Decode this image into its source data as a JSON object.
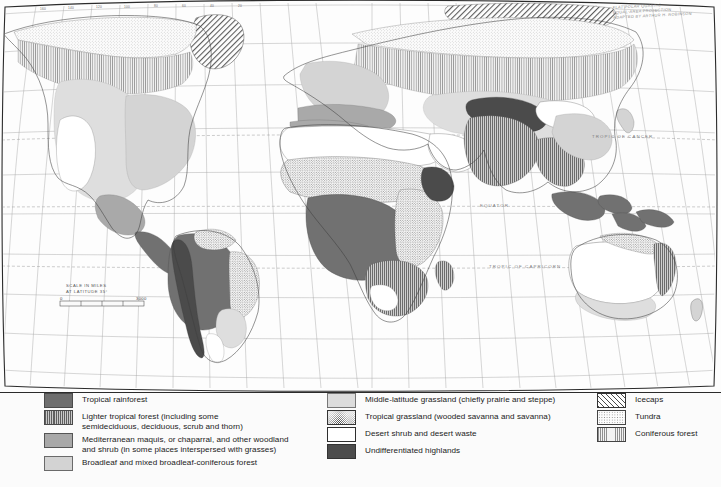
{
  "map": {
    "title": "World Natural Vegetation Map",
    "projection_credit": {
      "line1": "FLAT POLAR QUARTIC",
      "line2": "EQUAL-AREA PROJECTION",
      "line3": "ADAPTED BY ARTHUR H. ROBINSON"
    },
    "labels": {
      "tropic_of_cancer": "TROPIC OF CANCER",
      "equator": "EQUATOR",
      "tropic_of_capricorn": "TROPIC OF CAPRICORN"
    },
    "scale_bar": {
      "line1": "SCALE IN MILES",
      "line2": "AT LATITUDE 35°",
      "min": "0",
      "max": "3000"
    },
    "graticule_longitude_labels": [
      "160",
      "140",
      "120",
      "100",
      "80",
      "60",
      "40",
      "20"
    ],
    "graticule_longitude_x": [
      42,
      70,
      98,
      126,
      154,
      182,
      210,
      238
    ]
  },
  "legend": {
    "columns": [
      {
        "id": "column-1",
        "items": [
          {
            "swatch": "sw-rainforest",
            "name": "tropical-rainforest",
            "label": "Tropical rainforest"
          },
          {
            "swatch": "sw-lighter-tropical",
            "name": "lighter-tropical-forest",
            "label": "Lighter tropical forest (including some\nsemideciduous, deciduous, scrub and thorn)"
          },
          {
            "swatch": "sw-mediterranean",
            "name": "mediterranean-maquis",
            "label": "Mediterranean maquis, or chaparral, and other woodland\nand shrub (in some places interspersed with grasses)"
          },
          {
            "swatch": "sw-broadleaf",
            "name": "broadleaf-mixed-forest",
            "label": "Broadleaf and mixed broadleaf-coniferous forest"
          }
        ]
      },
      {
        "id": "column-2",
        "items": [
          {
            "swatch": "sw-midlat-grass",
            "name": "middle-latitude-grassland",
            "label": "Middle-latitude grassland (chiefly prairie and steppe)"
          },
          {
            "swatch": "sw-tropical-grass",
            "name": "tropical-grassland",
            "label": "Tropical grassland (wooded savanna and savanna)"
          },
          {
            "swatch": "sw-desert",
            "name": "desert-shrub-and-waste",
            "label": "Desert shrub and desert waste"
          },
          {
            "swatch": "sw-highlands",
            "name": "undifferentiated-highlands",
            "label": "Undifferentiated highlands"
          }
        ]
      },
      {
        "id": "column-3",
        "items": [
          {
            "swatch": "sw-icecaps",
            "name": "icecaps",
            "label": "Icecaps"
          },
          {
            "swatch": "sw-tundra",
            "name": "tundra",
            "label": "Tundra"
          },
          {
            "swatch": "sw-coniferous",
            "name": "coniferous-forest",
            "label": "Coniferous forest"
          }
        ]
      }
    ]
  },
  "colors": {
    "rainforest": "#6e6e6e",
    "mediterranean": "#a8a8a8",
    "broadleaf": "#d3d3d3",
    "grassland": "#dcdcdc",
    "highlands": "#4c4c4c",
    "border": "#2b2b2b",
    "graticule": "#9a9a9a",
    "coastline": "#3a3a3a"
  }
}
